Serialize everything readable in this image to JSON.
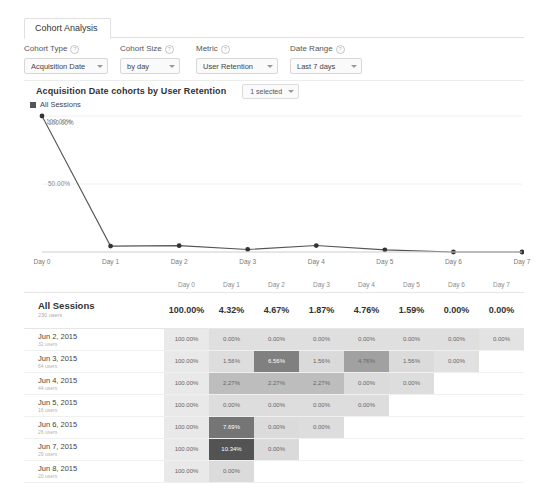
{
  "tab": {
    "label": "Cohort Analysis"
  },
  "controls": [
    {
      "label": "Cohort Type",
      "value": "Acquisition Date",
      "help": "?"
    },
    {
      "label": "Cohort Size",
      "value": "by day",
      "help": "?"
    },
    {
      "label": "Metric",
      "value": "User Retention",
      "help": "?"
    },
    {
      "label": "Date Range",
      "value": "Last 7 days",
      "help": "?"
    }
  ],
  "report": {
    "title": "Acquisition Date cohorts by User Retention",
    "selector_label": "1 selected"
  },
  "chart_data": {
    "type": "line",
    "title": "",
    "xlabel": "",
    "ylabel": "",
    "categories": [
      "Day 0",
      "Day 1",
      "Day 2",
      "Day 3",
      "Day 4",
      "Day 5",
      "Day 6",
      "Day 7"
    ],
    "series": [
      {
        "name": "All Sessions",
        "values": [
          100.0,
          4.32,
          4.67,
          1.87,
          4.76,
          1.59,
          0.0,
          0.0
        ]
      }
    ],
    "ylim": [
      0,
      100
    ],
    "yticks": [
      50,
      100
    ],
    "ytick_labels": [
      "50.00%",
      "100.00%"
    ],
    "point_label": "100.00%",
    "grid": true,
    "legend_position": "top-left",
    "line_color": "#555555",
    "marker_color": "#333333"
  },
  "table": {
    "columns": [
      "",
      "Day 0",
      "Day 1",
      "Day 2",
      "Day 3",
      "Day 4",
      "Day 5",
      "Day 6",
      "Day 7"
    ],
    "total_row": {
      "label": "All Sessions",
      "sub": "230 users",
      "values": [
        "100.00%",
        "4.32%",
        "4.67%",
        "1.87%",
        "4.76%",
        "1.59%",
        "0.00%",
        "0.00%"
      ]
    },
    "rows": [
      {
        "label": "Jun 2, 2015",
        "sub": "32 users",
        "values": [
          "100.00%",
          "0.00%",
          "0.00%",
          "0.00%",
          "0.00%",
          "0.00%",
          "0.00%",
          "0.00%"
        ],
        "shades": [
          0.07,
          0.12,
          0.12,
          0.12,
          0.12,
          0.12,
          0.12,
          0.1
        ]
      },
      {
        "label": "Jun 3, 2015",
        "sub": "64 users",
        "values": [
          "100.00%",
          "1.56%",
          "6.56%",
          "1.56%",
          "4.76%",
          "1.56%",
          "0.00%",
          ""
        ],
        "shades": [
          0.07,
          0.13,
          0.62,
          0.15,
          0.45,
          0.14,
          0.11,
          0.0
        ]
      },
      {
        "label": "Jun 4, 2015",
        "sub": "44 users",
        "values": [
          "100.00%",
          "2.27%",
          "2.27%",
          "2.27%",
          "0.00%",
          "0.00%",
          "",
          ""
        ],
        "shades": [
          0.07,
          0.3,
          0.3,
          0.3,
          0.14,
          0.13,
          0.0,
          0.0
        ]
      },
      {
        "label": "Jun 5, 2015",
        "sub": "16 users",
        "values": [
          "100.00%",
          "0.00%",
          "0.00%",
          "0.00%",
          "0.00%",
          "",
          "",
          ""
        ],
        "shades": [
          0.07,
          0.13,
          0.13,
          0.13,
          0.13,
          0.0,
          0.0,
          0.0
        ]
      },
      {
        "label": "Jun 6, 2015",
        "sub": "26 users",
        "values": [
          "100.00%",
          "7.69%",
          "0.00%",
          "0.00%",
          "",
          "",
          "",
          ""
        ],
        "shades": [
          0.07,
          0.68,
          0.14,
          0.13,
          0.0,
          0.0,
          0.0,
          0.0
        ]
      },
      {
        "label": "Jun 7, 2015",
        "sub": "29 users",
        "values": [
          "100.00%",
          "10.34%",
          "0.00%",
          "",
          "",
          "",
          "",
          ""
        ],
        "shades": [
          0.07,
          0.86,
          0.15,
          0.0,
          0.0,
          0.0,
          0.0,
          0.0
        ]
      },
      {
        "label": "Jun 8, 2015",
        "sub": "20 users",
        "values": [
          "100.00%",
          "0.00%",
          "",
          "",
          "",
          "",
          "",
          ""
        ],
        "shades": [
          0.07,
          0.14,
          0.0,
          0.0,
          0.0,
          0.0,
          0.0,
          0.0
        ]
      }
    ]
  }
}
